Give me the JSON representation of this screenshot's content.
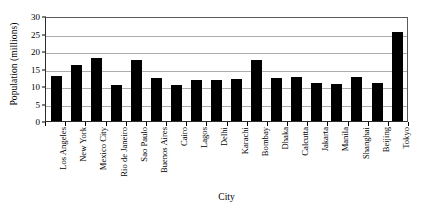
{
  "chart_data": {
    "type": "bar",
    "title": "",
    "xlabel": "City",
    "ylabel": "Population (millions)",
    "ylim": [
      0,
      30
    ],
    "yticks": [
      0,
      5,
      10,
      15,
      20,
      25,
      30
    ],
    "grid": true,
    "legend": false,
    "bar_color": "#000000",
    "categories": [
      "Los Angeles",
      "New York",
      "Mexico City",
      "Rio de Janeiro",
      "Sao Paulo",
      "Buenos Aires",
      "Cairo",
      "Lagos",
      "Delhi",
      "Karachi",
      "Bombay",
      "Dhaka",
      "Calcutta",
      "Jakarta",
      "Manila",
      "Shanghai",
      "Beijing",
      "Tokyo"
    ],
    "values": [
      13.0,
      16.1,
      18.0,
      10.4,
      17.5,
      12.3,
      10.4,
      11.8,
      11.7,
      11.9,
      17.5,
      12.3,
      12.7,
      11.0,
      10.5,
      12.6,
      10.8,
      25.5
    ]
  }
}
